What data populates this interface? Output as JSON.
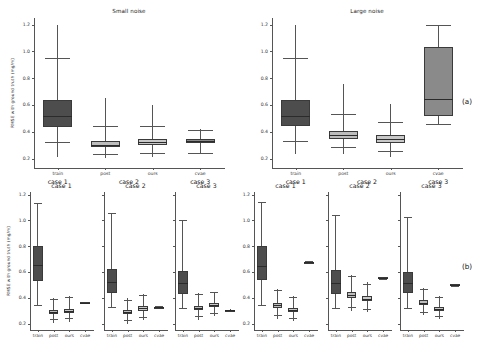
{
  "figure": {
    "ylabel": "RMSE with ground truth (mg/m)",
    "panel_a_tag": "(a)",
    "panel_b_tag": "(b)",
    "yticks": [
      "0.2",
      "0.4",
      "0.6",
      "0.8",
      "1.0",
      "1.2"
    ],
    "ylim": [
      0.13,
      1.25
    ],
    "methods": [
      "train",
      "post",
      "ours",
      "cvae"
    ],
    "group_labels": [
      "case 1",
      "case 2",
      "case 3"
    ],
    "case_titles": [
      "case 1",
      "case 2",
      "case 3"
    ],
    "noise_titles": [
      "Small noise",
      "Large noise"
    ],
    "colors": {
      "train": "#4d4d4d",
      "post": "#bdbdbd",
      "ours": "#c8c8c8",
      "cvae": "#8a8a8a",
      "axis": "#555555",
      "text": "#1a1a1a"
    }
  },
  "chart_data": [
    {
      "type": "box",
      "id": "panel-a-small-noise",
      "title": "Small noise",
      "xlabel": "",
      "ylabel": "RMSE with ground truth (mg/m)",
      "ylim": [
        0.13,
        1.25
      ],
      "yticks": [
        0.2,
        0.4,
        0.6,
        0.8,
        1.0,
        1.2
      ],
      "grid": false,
      "categories": [
        "train",
        "post",
        "ours",
        "cvae"
      ],
      "group_labels": [
        "case 1",
        "case 2",
        "case 3"
      ],
      "boxes": [
        {
          "label": "train",
          "group": "case 1",
          "q1": 0.435,
          "median": 0.515,
          "q3": 0.635,
          "whisker_low": 0.215,
          "whisker_high": 1.195,
          "cap_low": 0.325,
          "cap_high": 0.955,
          "color": "#4d4d4d"
        },
        {
          "label": "post",
          "group": "case 2",
          "q1": 0.285,
          "median": 0.305,
          "q3": 0.33,
          "whisker_low": 0.205,
          "whisker_high": 0.655,
          "cap_low": 0.235,
          "cap_high": 0.44,
          "color": "#bdbdbd"
        },
        {
          "label": "ours",
          "group": "case 2",
          "q1": 0.305,
          "median": 0.325,
          "q3": 0.345,
          "whisker_low": 0.21,
          "whisker_high": 0.6,
          "cap_low": 0.245,
          "cap_high": 0.44,
          "color": "#c8c8c8"
        },
        {
          "label": "cvae",
          "group": "case 3",
          "q1": 0.315,
          "median": 0.33,
          "q3": 0.345,
          "whisker_low": 0.235,
          "whisker_high": 0.42,
          "cap_low": 0.24,
          "cap_high": 0.415,
          "color": "#8a8a8a"
        }
      ]
    },
    {
      "type": "box",
      "id": "panel-a-large-noise",
      "title": "Large noise",
      "xlabel": "",
      "ylabel": "",
      "ylim": [
        0.13,
        1.25
      ],
      "yticks": [
        0.2,
        0.4,
        0.6,
        0.8,
        1.0,
        1.2
      ],
      "grid": false,
      "categories": [
        "train",
        "post",
        "ours",
        "cvae"
      ],
      "group_labels": [
        "case 1",
        "case 2",
        "case 3"
      ],
      "boxes": [
        {
          "label": "train",
          "group": "case 1",
          "q1": 0.44,
          "median": 0.52,
          "q3": 0.635,
          "whisker_low": 0.235,
          "whisker_high": 1.195,
          "cap_low": 0.33,
          "cap_high": 0.955,
          "color": "#4d4d4d"
        },
        {
          "label": "post",
          "group": "case 2",
          "q1": 0.35,
          "median": 0.378,
          "q3": 0.41,
          "whisker_low": 0.235,
          "whisker_high": 0.755,
          "cap_low": 0.285,
          "cap_high": 0.53,
          "color": "#bdbdbd"
        },
        {
          "label": "ours",
          "group": "case 2",
          "q1": 0.318,
          "median": 0.345,
          "q3": 0.375,
          "whisker_low": 0.215,
          "whisker_high": 0.605,
          "cap_low": 0.255,
          "cap_high": 0.475,
          "color": "#c8c8c8"
        },
        {
          "label": "cvae",
          "group": "case 3",
          "q1": 0.515,
          "median": 0.645,
          "q3": 1.035,
          "whisker_low": 0.455,
          "whisker_high": 1.195,
          "cap_low": 0.455,
          "cap_high": 1.195,
          "color": "#8a8a8a"
        }
      ]
    },
    {
      "type": "box",
      "id": "panel-b-small-case1",
      "title": "case 1",
      "xlabel": "",
      "ylabel": "RMSE with ground truth (mg/m)",
      "ylim": [
        0.15,
        1.22
      ],
      "yticks": [
        0.2,
        0.4,
        0.6,
        0.8,
        1.0,
        1.2
      ],
      "grid": false,
      "categories": [
        "train",
        "post",
        "ours",
        "cvae"
      ],
      "boxes": [
        {
          "label": "train",
          "q1": 0.53,
          "median": 0.655,
          "q3": 0.805,
          "whisker_low": 0.34,
          "whisker_high": 1.135,
          "cap_low": 0.34,
          "cap_high": 1.135,
          "color": "#4d4d4d"
        },
        {
          "label": "post",
          "q1": 0.272,
          "median": 0.288,
          "q3": 0.305,
          "whisker_low": 0.205,
          "whisker_high": 0.395,
          "cap_low": 0.232,
          "cap_high": 0.392,
          "color": "#bdbdbd"
        },
        {
          "label": "ours",
          "q1": 0.285,
          "median": 0.3,
          "q3": 0.315,
          "whisker_low": 0.215,
          "whisker_high": 0.41,
          "cap_low": 0.24,
          "cap_high": 0.405,
          "color": "#c8c8c8"
        },
        {
          "label": "cvae",
          "q1": 0.358,
          "median": 0.362,
          "q3": 0.366,
          "whisker_low": 0.355,
          "whisker_high": 0.37,
          "cap_low": 0.356,
          "cap_high": 0.368,
          "color": "#8a8a8a"
        }
      ]
    },
    {
      "type": "box",
      "id": "panel-b-small-case2",
      "title": "case 2",
      "xlabel": "",
      "ylabel": "",
      "ylim": [
        0.15,
        1.22
      ],
      "yticks": [
        0.2,
        0.4,
        0.6,
        0.8,
        1.0,
        1.2
      ],
      "grid": false,
      "categories": [
        "train",
        "post",
        "ours",
        "cvae"
      ],
      "boxes": [
        {
          "label": "train",
          "q1": 0.44,
          "median": 0.52,
          "q3": 0.625,
          "whisker_low": 0.325,
          "whisker_high": 1.06,
          "cap_low": 0.325,
          "cap_high": 1.06,
          "color": "#4d4d4d"
        },
        {
          "label": "post",
          "q1": 0.272,
          "median": 0.288,
          "q3": 0.308,
          "whisker_low": 0.2,
          "whisker_high": 0.395,
          "cap_low": 0.225,
          "cap_high": 0.385,
          "color": "#bdbdbd"
        },
        {
          "label": "ours",
          "q1": 0.3,
          "median": 0.318,
          "q3": 0.338,
          "whisker_low": 0.23,
          "whisker_high": 0.43,
          "cap_low": 0.252,
          "cap_high": 0.425,
          "color": "#c8c8c8"
        },
        {
          "label": "cvae",
          "q1": 0.322,
          "median": 0.326,
          "q3": 0.33,
          "whisker_low": 0.318,
          "whisker_high": 0.334,
          "cap_low": 0.319,
          "cap_high": 0.333,
          "color": "#8a8a8a"
        }
      ]
    },
    {
      "type": "box",
      "id": "panel-b-small-case3",
      "title": "case 3",
      "xlabel": "",
      "ylabel": "",
      "ylim": [
        0.15,
        1.22
      ],
      "yticks": [
        0.2,
        0.4,
        0.6,
        0.8,
        1.0,
        1.2
      ],
      "grid": false,
      "categories": [
        "train",
        "post",
        "ours",
        "cvae"
      ],
      "boxes": [
        {
          "label": "train",
          "q1": 0.432,
          "median": 0.512,
          "q3": 0.61,
          "whisker_low": 0.32,
          "whisker_high": 1.0,
          "cap_low": 0.32,
          "cap_high": 1.0,
          "color": "#4d4d4d"
        },
        {
          "label": "post",
          "q1": 0.305,
          "median": 0.32,
          "q3": 0.338,
          "whisker_low": 0.228,
          "whisker_high": 0.44,
          "cap_low": 0.255,
          "cap_high": 0.432,
          "color": "#bdbdbd"
        },
        {
          "label": "ours",
          "q1": 0.328,
          "median": 0.342,
          "q3": 0.358,
          "whisker_low": 0.255,
          "whisker_high": 0.448,
          "cap_low": 0.278,
          "cap_high": 0.442,
          "color": "#c8c8c8"
        },
        {
          "label": "cvae",
          "q1": 0.3,
          "median": 0.303,
          "q3": 0.306,
          "whisker_low": 0.297,
          "whisker_high": 0.309,
          "cap_low": 0.298,
          "cap_high": 0.308,
          "color": "#8a8a8a"
        }
      ]
    },
    {
      "type": "box",
      "id": "panel-b-large-case1",
      "title": "case 1",
      "xlabel": "",
      "ylabel": "",
      "ylim": [
        0.15,
        1.22
      ],
      "yticks": [
        0.2,
        0.4,
        0.6,
        0.8,
        1.0,
        1.2
      ],
      "grid": false,
      "categories": [
        "train",
        "post",
        "ours",
        "cvae"
      ],
      "boxes": [
        {
          "label": "train",
          "q1": 0.535,
          "median": 0.65,
          "q3": 0.805,
          "whisker_low": 0.345,
          "whisker_high": 1.14,
          "cap_low": 0.345,
          "cap_high": 1.14,
          "color": "#4d4d4d"
        },
        {
          "label": "post",
          "q1": 0.318,
          "median": 0.34,
          "q3": 0.362,
          "whisker_low": 0.238,
          "whisker_high": 0.47,
          "cap_low": 0.265,
          "cap_high": 0.462,
          "color": "#bdbdbd"
        },
        {
          "label": "ours",
          "q1": 0.288,
          "median": 0.302,
          "q3": 0.318,
          "whisker_low": 0.222,
          "whisker_high": 0.41,
          "cap_low": 0.245,
          "cap_high": 0.405,
          "color": "#c8c8c8"
        },
        {
          "label": "cvae",
          "q1": 0.672,
          "median": 0.676,
          "q3": 0.68,
          "whisker_low": 0.668,
          "whisker_high": 0.684,
          "cap_low": 0.669,
          "cap_high": 0.683,
          "color": "#8a8a8a"
        }
      ]
    },
    {
      "type": "box",
      "id": "panel-b-large-case2",
      "title": "case 2",
      "xlabel": "",
      "ylabel": "",
      "ylim": [
        0.15,
        1.22
      ],
      "yticks": [
        0.2,
        0.4,
        0.6,
        0.8,
        1.0,
        1.2
      ],
      "grid": false,
      "categories": [
        "train",
        "post",
        "ours",
        "cvae"
      ],
      "boxes": [
        {
          "label": "train",
          "q1": 0.432,
          "median": 0.512,
          "q3": 0.615,
          "whisker_low": 0.318,
          "whisker_high": 1.045,
          "cap_low": 0.318,
          "cap_high": 1.045,
          "color": "#4d4d4d"
        },
        {
          "label": "post",
          "q1": 0.395,
          "median": 0.42,
          "q3": 0.448,
          "whisker_low": 0.3,
          "whisker_high": 0.58,
          "cap_low": 0.325,
          "cap_high": 0.565,
          "color": "#bdbdbd"
        },
        {
          "label": "ours",
          "q1": 0.372,
          "median": 0.392,
          "q3": 0.415,
          "whisker_low": 0.29,
          "whisker_high": 0.52,
          "cap_low": 0.312,
          "cap_high": 0.51,
          "color": "#c8c8c8"
        },
        {
          "label": "cvae",
          "q1": 0.552,
          "median": 0.556,
          "q3": 0.56,
          "whisker_low": 0.548,
          "whisker_high": 0.564,
          "cap_low": 0.549,
          "cap_high": 0.563,
          "color": "#8a8a8a"
        }
      ]
    },
    {
      "type": "box",
      "id": "panel-b-large-case3",
      "title": "case 3",
      "xlabel": "",
      "ylabel": "",
      "ylim": [
        0.15,
        1.22
      ],
      "yticks": [
        0.2,
        0.4,
        0.6,
        0.8,
        1.0,
        1.2
      ],
      "grid": false,
      "categories": [
        "train",
        "post",
        "ours",
        "cvae"
      ],
      "boxes": [
        {
          "label": "train",
          "q1": 0.435,
          "median": 0.512,
          "q3": 0.598,
          "whisker_low": 0.322,
          "whisker_high": 1.03,
          "cap_low": 0.322,
          "cap_high": 1.03,
          "color": "#4d4d4d"
        },
        {
          "label": "post",
          "q1": 0.345,
          "median": 0.362,
          "q3": 0.382,
          "whisker_low": 0.268,
          "whisker_high": 0.475,
          "cap_low": 0.292,
          "cap_high": 0.468,
          "color": "#bdbdbd"
        },
        {
          "label": "ours",
          "q1": 0.295,
          "median": 0.31,
          "q3": 0.325,
          "whisker_low": 0.232,
          "whisker_high": 0.41,
          "cap_low": 0.255,
          "cap_high": 0.402,
          "color": "#c8c8c8"
        },
        {
          "label": "cvae",
          "q1": 0.498,
          "median": 0.502,
          "q3": 0.506,
          "whisker_low": 0.494,
          "whisker_high": 0.51,
          "cap_low": 0.495,
          "cap_high": 0.509,
          "color": "#8a8a8a"
        }
      ]
    }
  ]
}
